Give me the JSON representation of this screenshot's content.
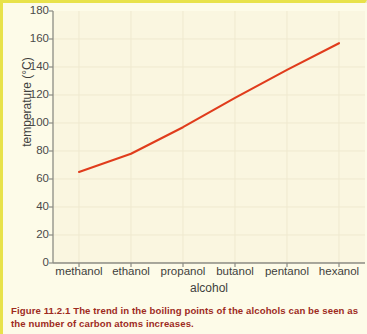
{
  "figure": {
    "caption_prefix": "Figure 11.2.1",
    "caption_body": " The trend in the boiling points of the alcohols can be seen as the number of carbon atoms increases.",
    "accent_color": "#e8e24a",
    "line_color": "#e03c1c",
    "plot_background": "#faf6e0",
    "page_background": "#fdfbe8",
    "caption_color": "#9e2b1e"
  },
  "chart_data": {
    "type": "line",
    "title": "",
    "xlabel": "alcohol",
    "ylabel": "temperature (°C)",
    "categories": [
      "methanol",
      "ethanol",
      "propanol",
      "butanol",
      "pentanol",
      "hexanol"
    ],
    "values": [
      65,
      78,
      97,
      118,
      138,
      157
    ],
    "series": [
      {
        "name": "boiling point",
        "values": [
          65,
          78,
          97,
          118,
          138,
          157
        ]
      }
    ],
    "ylim": [
      0,
      180
    ],
    "yticks": [
      0,
      20,
      40,
      60,
      80,
      100,
      120,
      140,
      160,
      180
    ],
    "ytick_labels": [
      "0",
      "20",
      "40",
      "60",
      "80",
      "100",
      "120",
      "140",
      "160",
      "180"
    ],
    "grid": true,
    "legend": false,
    "legend_position": "none"
  }
}
